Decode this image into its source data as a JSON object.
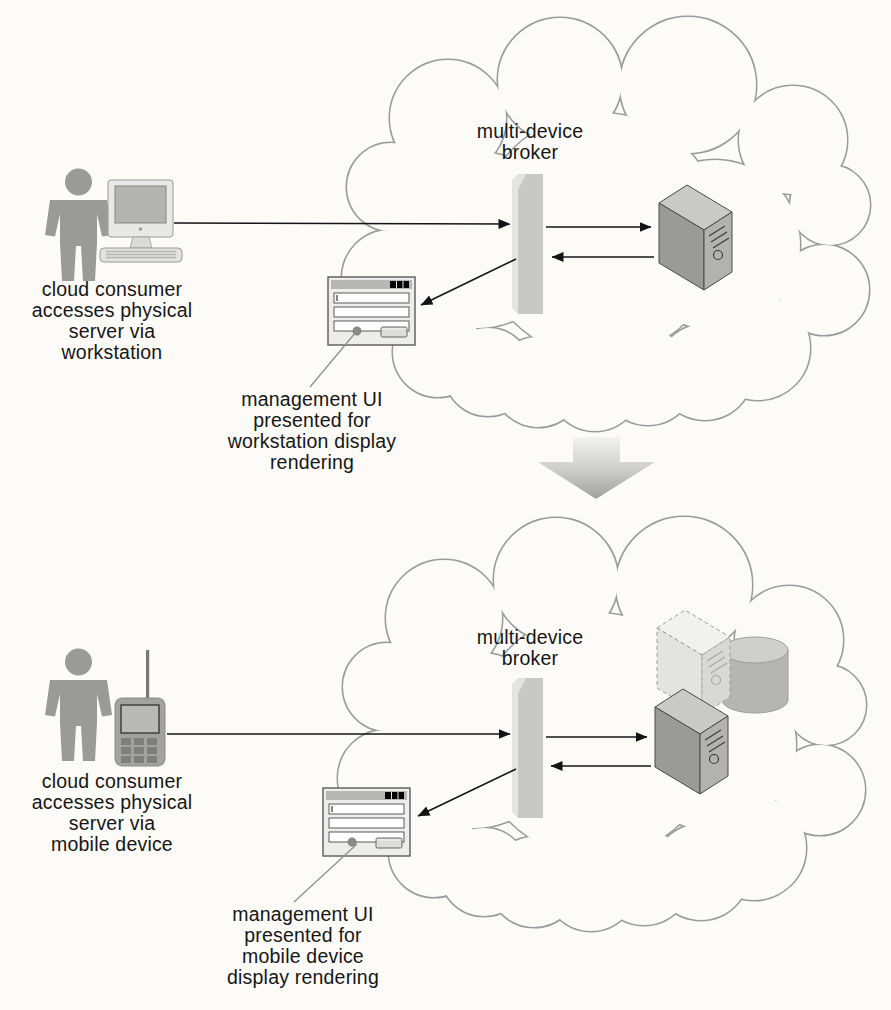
{
  "figure": {
    "background": "#fcfbf8",
    "cloud_outline_color": "#9b9b9b",
    "arrow_color": "#141414",
    "broker_color": "#c8c8c6",
    "server_color": "#9a9a98"
  },
  "top_scene": {
    "consumer_caption": "cloud consumer\naccesses physical\nserver via\nworkstation",
    "broker_label": "multi-device\nbroker",
    "ui_caption": "management UI\npresented for\nworkstation display\nrendering"
  },
  "bottom_scene": {
    "consumer_caption": "cloud consumer\naccesses physical\nserver via\nmobile device",
    "broker_label": "multi-device\nbroker",
    "ui_caption": "management UI\npresented for\nmobile device\ndisplay rendering"
  },
  "icons": {
    "person": "person-icon",
    "workstation": "workstation-icon",
    "mobile_phone": "mobile-phone-icon",
    "broker_panel": "multi-device-broker-panel-icon",
    "physical_server": "physical-server-icon",
    "virtual_server": "virtual-server-ghost-icon",
    "storage": "storage-cylinder-icon",
    "management_ui": "management-ui-window-icon",
    "transition": "down-arrow-icon"
  }
}
